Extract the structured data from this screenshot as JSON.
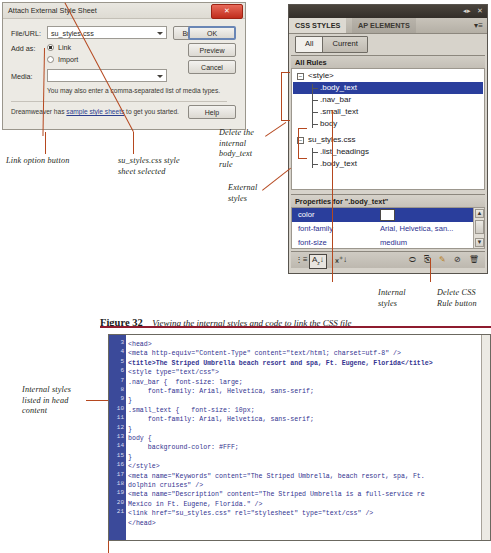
{
  "dialog": {
    "title": "Attach External Style Sheet",
    "close_label": "✕",
    "file_url_label": "File/URL:",
    "file_url_value": "su_styles.css",
    "browse_label": "Browse...",
    "add_as_label": "Add as:",
    "add_as_link": "Link",
    "add_as_import": "Import",
    "media_label": "Media:",
    "media_value": "",
    "note": "You may also enter a comma-separated list of media types.",
    "footer_prefix": "Dreamweaver has",
    "footer_link": "sample style sheets",
    "footer_suffix": "to get you started.",
    "ok_label": "OK",
    "preview_label": "Preview",
    "cancel_label": "Cancel",
    "help_label": "Help"
  },
  "panel": {
    "tabs": [
      {
        "label": "CSS STYLES",
        "active": true
      },
      {
        "label": "AP ELEMENTS",
        "active": false
      }
    ],
    "segments": [
      {
        "label": "All",
        "active": true
      },
      {
        "label": "Current",
        "active": false
      }
    ],
    "all_rules_label": "All Rules",
    "rules": [
      {
        "label": "<style>",
        "indent": 0,
        "toggle": "−",
        "selected": false
      },
      {
        "label": ".body_text",
        "indent": 1,
        "selected": true
      },
      {
        "label": ".nav_bar",
        "indent": 1,
        "selected": false
      },
      {
        "label": ".small_text",
        "indent": 1,
        "selected": false
      },
      {
        "label": "body",
        "indent": 1,
        "selected": false
      },
      {
        "label": "su_styles.css",
        "indent": 0,
        "toggle": "−",
        "selected": false
      },
      {
        "label": ".list_headings",
        "indent": 1,
        "selected": false
      },
      {
        "label": ".body_text",
        "indent": 1,
        "selected": false
      }
    ],
    "properties_title": "Properties for \".body_text\"",
    "properties": [
      {
        "name": "color",
        "value": "",
        "swatch": "#ffffff",
        "selected": true
      },
      {
        "name": "font-family",
        "value": "Arial, Helvetica, san...",
        "selected": false
      },
      {
        "name": "font-size",
        "value": "medium",
        "selected": false
      }
    ],
    "toolbar_icons": [
      "category-view-icon",
      "alphabetical-view-icon",
      "set-properties-view-icon",
      "attach-style-sheet-icon",
      "new-css-rule-icon",
      "edit-rule-icon",
      "disable-property-icon",
      "delete-css-rule-icon"
    ]
  },
  "caption": {
    "label": "Figure 32",
    "text": "Viewing the internal styles and code to link the CSS file"
  },
  "annotations": [
    {
      "id": "link-option-button",
      "text": "Link option button"
    },
    {
      "id": "style-sheet-selected",
      "text": "su_styles.css style\nsheet selected"
    },
    {
      "id": "delete-internal-rule",
      "text": "Delete the\ninternal\nbody_text\nrule"
    },
    {
      "id": "external-styles",
      "text": "External\nstyles"
    },
    {
      "id": "internal-styles",
      "text": "Internal\nstyles"
    },
    {
      "id": "delete-css-rule-button",
      "text": "Delete CSS\nRule button"
    },
    {
      "id": "internal-styles-head",
      "text": "Internal styles\nlisted in head\ncontent"
    }
  ],
  "code": {
    "line_numbers": [
      3,
      4,
      5,
      6,
      7,
      8,
      9,
      10,
      11,
      12,
      13,
      14,
      15,
      16,
      17,
      18,
      19,
      20,
      21
    ],
    "lines": [
      "<head>",
      "<meta http-equiv=\"Content-Type\" content=\"text/html; charset=utf-8\" />",
      "<title>The Striped Umbrella beach resort and spa, Ft. Eugene, Florida</title>",
      "<style type=\"text/css\">",
      ".nav_bar {  font-size: large;",
      "     font-family: Arial, Helvetica, sans-serif;",
      "}",
      ".small_text {   font-size: 10px;",
      "     font-family: Arial, Helvetica, sans-serif;",
      "}",
      "body {",
      "     background-color: #FFF;",
      "}",
      "</style>",
      "<meta name=\"Keywords\" content=\"The Striped Umbrella, beach resort, spa, Ft.",
      "dolphin cruises\" />",
      "<meta name=\"Description\" content=\"The Striped Umbrella is a full-service re",
      "Mexico in Ft. Eugene, Florida.\" />",
      "<link href=\"su_styles.css\" rel=\"stylesheet\" type=\"text/css\" />",
      "</head>"
    ],
    "bold_line_index": 2
  },
  "colors": {
    "selection_blue": "#2a3e9c",
    "annotation_rule": "#b5481f",
    "caption_rule": "#8e1b2e",
    "code_text": "#33338f",
    "gutter": "#3b4a9a"
  }
}
